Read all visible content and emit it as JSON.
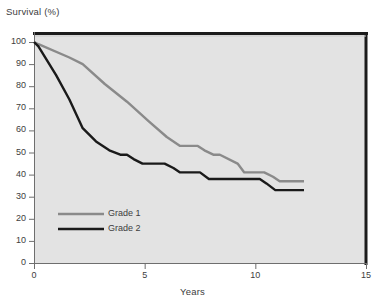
{
  "chart_data": {
    "type": "line",
    "title": "",
    "xlabel": "Years",
    "ylabel": "Survival (%)",
    "xlim": [
      0,
      15
    ],
    "ylim": [
      0,
      100
    ],
    "xticks": [
      0,
      5,
      10,
      15
    ],
    "yticks": [
      0,
      10,
      20,
      30,
      40,
      50,
      60,
      70,
      80,
      90,
      100
    ],
    "grid": false,
    "legend_position": "inside-lower-left",
    "plot_background": "#e3e3e3",
    "series": [
      {
        "name": "Grade 1",
        "color": "#8a8a8a",
        "x": [
          0.0,
          0.2,
          1.6,
          2.2,
          3.2,
          4.2,
          5.2,
          6.0,
          6.6,
          6.9,
          7.4,
          7.7,
          8.1,
          8.4,
          9.2,
          9.5,
          10.1,
          10.4,
          10.8,
          11.1,
          12.2
        ],
        "y": [
          100,
          99,
          93,
          90,
          81,
          73,
          64,
          57,
          53,
          53,
          53,
          51,
          49,
          49,
          45,
          41,
          41,
          41,
          39,
          37,
          37
        ]
      },
      {
        "name": "Grade 2",
        "color": "#1a1a1a",
        "x": [
          0.0,
          0.2,
          1.0,
          1.6,
          2.2,
          2.8,
          3.4,
          3.9,
          4.2,
          4.5,
          4.9,
          5.6,
          5.9,
          6.3,
          6.6,
          7.2,
          7.5,
          7.9,
          8.6,
          9.3,
          10.2,
          10.5,
          10.9,
          12.2
        ],
        "y": [
          100,
          98,
          85,
          74,
          61,
          55,
          51,
          49,
          49,
          47,
          45,
          45,
          45,
          43,
          41,
          41,
          41,
          38,
          38,
          38,
          38,
          36,
          33,
          33
        ]
      }
    ]
  },
  "axes": {
    "ylabel_text": "Survival (%)",
    "xlabel_text": "Years",
    "ytick_labels": [
      "100",
      "90",
      "80",
      "70",
      "60",
      "50",
      "40",
      "30",
      "20",
      "10",
      "0"
    ],
    "xtick_labels": [
      "0",
      "5",
      "10",
      "15"
    ]
  },
  "legend": {
    "entries": [
      {
        "label": "Grade 1",
        "color": "#8a8a8a"
      },
      {
        "label": "Grade 2",
        "color": "#1a1a1a"
      }
    ]
  }
}
